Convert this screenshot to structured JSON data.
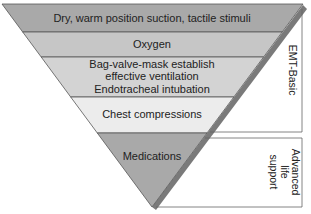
{
  "diagram": {
    "type": "inverted-pyramid",
    "bands": [
      {
        "label": "Dry, warm position suction, tactile stimuli",
        "color": "#a9a9a9"
      },
      {
        "label": "Oxygen",
        "color": "#c6c6c6"
      },
      {
        "label_line1": "Bag-valve-mask establish",
        "label_line2": "effective ventilation",
        "label_line3": "Endotracheal intubation",
        "color": "#d3d3d3"
      },
      {
        "label": "Chest compressions",
        "color": "#ececec"
      },
      {
        "label": "Medications",
        "color": "#a9a9a9"
      }
    ],
    "brackets": [
      {
        "label": "EMT-Basic"
      },
      {
        "label_line1": "Advanced",
        "label_line2": "life",
        "label_line3": "support"
      }
    ],
    "colors": {
      "shadow": "#7a7a7a",
      "outline": "#555555",
      "text": "#222222"
    }
  }
}
